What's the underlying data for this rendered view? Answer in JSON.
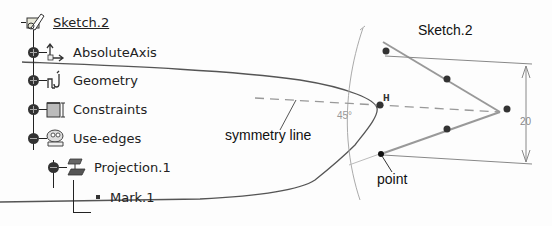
{
  "tree": {
    "root": {
      "label": "Sketch.2",
      "icon": "sketch-icon"
    },
    "items": [
      {
        "label": "AbsoluteAxis",
        "icon": "axis-icon",
        "expander": "plus"
      },
      {
        "label": "Geometry",
        "icon": "geometry-icon",
        "expander": "plus"
      },
      {
        "label": "Constraints",
        "icon": "constraints-icon",
        "expander": "plus"
      },
      {
        "label": "Use-edges",
        "icon": "use-edges-icon",
        "expander": "minus"
      }
    ],
    "projection": {
      "label": "Projection.1",
      "icon": "projection-icon",
      "expander": "minus"
    },
    "mark": {
      "label": "Mark.1",
      "icon": "mark-bullet-icon"
    }
  },
  "viewport": {
    "sketch_title": "Sketch.2",
    "annotations": {
      "symmetry_line": "symmetry line",
      "point": "point"
    },
    "dimension_value": "20",
    "angle_value": "45°",
    "colors": {
      "geometry": "#999999",
      "construction": "#aaaaaa",
      "point": "#111111",
      "profile": "#555555"
    }
  }
}
